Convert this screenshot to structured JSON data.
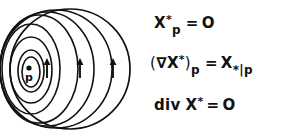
{
  "figure": {
    "background_color": "#ffffff",
    "ink_color": "#111111"
  },
  "diagram": {
    "name": "sphere-with-nested-level-sets",
    "point_label": "p",
    "point_marker": "dot",
    "arrow_count": 3,
    "arrow_direction": "up",
    "nested_curve_count": 7,
    "outer_shape": "circle"
  },
  "equations": {
    "line1": {
      "lhs_symbol": "X",
      "lhs_superscript": "*",
      "lhs_subscript": "p",
      "relation": "=",
      "rhs": "O"
    },
    "line2": {
      "open_paren": "(",
      "nabla": "∇",
      "symbol": "X",
      "superscript": "*",
      "close_paren": ")",
      "subscript": "p",
      "relation": "=",
      "rhs_symbol": "X",
      "rhs_subscript": "*",
      "rhs_bar": "|",
      "rhs_point": "p"
    },
    "line3": {
      "operator": "div",
      "symbol": "X",
      "superscript": "*",
      "relation": "=",
      "rhs": "O"
    }
  }
}
